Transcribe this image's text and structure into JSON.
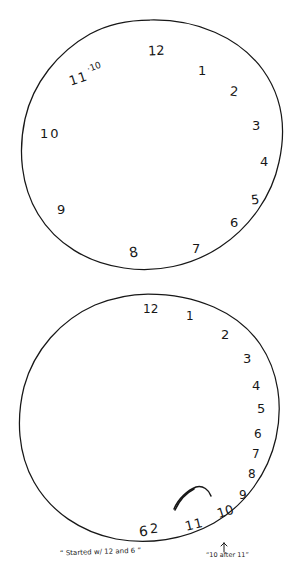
{
  "document": {
    "title": "Clock Drawing Test - two hand-drawn clock faces",
    "background_color": "#ffffff",
    "ink_color": "#171717"
  },
  "clocks": [
    {
      "id": "clock-top",
      "name": "top-clock-face",
      "description": "Hand-drawn circle with numbers placed unevenly, no clock hands drawn",
      "has_hands": false,
      "numbers": [
        {
          "label": "12",
          "x": 148,
          "y": 44,
          "size": 13,
          "rot": -3
        },
        {
          "label": "1",
          "x": 198,
          "y": 64,
          "size": 13,
          "rot": 0
        },
        {
          "label": "2",
          "x": 230,
          "y": 85,
          "size": 13,
          "rot": 6
        },
        {
          "label": "3",
          "x": 252,
          "y": 119,
          "size": 13,
          "rot": 0
        },
        {
          "label": "4",
          "x": 260,
          "y": 155,
          "size": 13,
          "rot": 0
        },
        {
          "label": "5",
          "x": 251,
          "y": 193,
          "size": 13,
          "rot": -6
        },
        {
          "label": "6",
          "x": 230,
          "y": 216,
          "size": 13,
          "rot": 0
        },
        {
          "label": "7",
          "x": 192,
          "y": 242,
          "size": 13,
          "rot": 0
        },
        {
          "label": "8",
          "x": 129,
          "y": 245,
          "size": 14,
          "rot": -10
        },
        {
          "label": "9",
          "x": 57,
          "y": 203,
          "size": 13,
          "rot": 0
        },
        {
          "label": "10",
          "x": 40,
          "y": 127,
          "size": 13,
          "rot": 0
        },
        {
          "label": "11",
          "x": 69,
          "y": 72,
          "size": 13,
          "rot": -18
        },
        {
          "label": "·10",
          "x": 87,
          "y": 63,
          "size": 9,
          "rot": -20
        }
      ]
    },
    {
      "id": "clock-bottom",
      "name": "bottom-clock-face",
      "description": "Second attempt; numbers crowd down the right side, clock hands drawn near 10 and 11",
      "has_hands": true,
      "numbers": [
        {
          "label": "12",
          "x": 143,
          "y": 303,
          "size": 12,
          "rot": 0
        },
        {
          "label": "1",
          "x": 186,
          "y": 310,
          "size": 12,
          "rot": 0
        },
        {
          "label": "2",
          "x": 221,
          "y": 328,
          "size": 13,
          "rot": 0
        },
        {
          "label": "3",
          "x": 243,
          "y": 352,
          "size": 13,
          "rot": 0
        },
        {
          "label": "4",
          "x": 252,
          "y": 379,
          "size": 13,
          "rot": 0
        },
        {
          "label": "5",
          "x": 257,
          "y": 402,
          "size": 13,
          "rot": 0
        },
        {
          "label": "6",
          "x": 254,
          "y": 428,
          "size": 12,
          "rot": 0
        },
        {
          "label": "7",
          "x": 252,
          "y": 448,
          "size": 12,
          "rot": 0
        },
        {
          "label": "8",
          "x": 248,
          "y": 468,
          "size": 12,
          "rot": 0
        },
        {
          "label": "9",
          "x": 239,
          "y": 489,
          "size": 12,
          "rot": 0
        },
        {
          "label": "10",
          "x": 217,
          "y": 505,
          "size": 13,
          "rot": -18
        },
        {
          "label": "11",
          "x": 185,
          "y": 518,
          "size": 13,
          "rot": -14
        },
        {
          "label": "6",
          "x": 139,
          "y": 524,
          "size": 14,
          "rot": -6
        },
        {
          "label": "2",
          "x": 150,
          "y": 522,
          "size": 13,
          "rot": -4
        }
      ]
    }
  ],
  "annotations": [
    {
      "id": "note-started",
      "name": "examiner-note-started",
      "text": "“ Started w/ 12 and 6 ”",
      "x": 60,
      "y": 549,
      "size": 7,
      "rot": -2,
      "has_arrow": false
    },
    {
      "id": "note-time",
      "name": "examiner-note-time-spoken",
      "text": "“10 after 11”",
      "x": 206,
      "y": 552,
      "size": 6,
      "rot": 0,
      "has_arrow": true,
      "arrow_label": "pointer-arrow-to-hands"
    }
  ]
}
